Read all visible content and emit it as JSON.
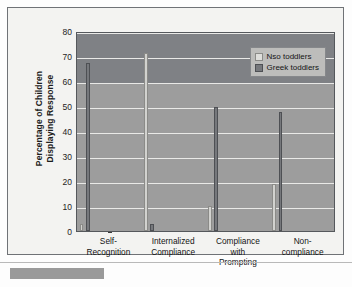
{
  "chart_data": {
    "type": "bar",
    "title": "",
    "xlabel": "",
    "ylabel": "Percentage of Children Displaying Response",
    "ylabel_lines": [
      "Percentage of Children",
      "Displaying Response"
    ],
    "ylim": [
      0,
      80
    ],
    "yticks": [
      0,
      10,
      20,
      30,
      40,
      50,
      60,
      70,
      80
    ],
    "ytick_labels": [
      "0",
      "10",
      "20",
      "30",
      "40",
      "50",
      "60",
      "70",
      "80"
    ],
    "grid": true,
    "legend_position": "top-right",
    "categories": [
      "Self-Recognition",
      "Internalized Compliance",
      "Compliance with Prompting",
      "Non-compliance"
    ],
    "category_lines": [
      [
        "Self-",
        "Recognition"
      ],
      [
        "Internalized",
        "Compliance"
      ],
      [
        "Compliance",
        "with",
        "Prompting"
      ],
      [
        "Non-",
        "compliance"
      ]
    ],
    "series": [
      {
        "name": "Nso toddlers",
        "color": "#d2d2cf",
        "values": [
          3,
          72,
          10,
          19
        ]
      },
      {
        "name": "Greek toddlers",
        "color": "#76787c",
        "values": [
          68,
          3,
          50,
          48
        ]
      }
    ]
  },
  "legend": {
    "items": [
      {
        "label": "Nso toddlers"
      },
      {
        "label": "Greek toddlers"
      }
    ]
  },
  "colors": {
    "plot_background_upper": "#7f8185",
    "plot_background_lower": "#9d9d9d",
    "card_background": "#f3f3f1",
    "gridline": "#e9e9e7",
    "axis": "#3a3a3a",
    "nso_bar": "#d2d2cf",
    "greek_bar": "#76787c",
    "legend_background": "#bdbdbb"
  }
}
